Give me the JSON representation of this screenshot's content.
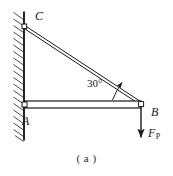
{
  "figure": {
    "caption": "( a )",
    "background_color": "#ffffff",
    "line_color": "#1a1a1a",
    "labels": {
      "joint_c": "C",
      "joint_a": "A",
      "joint_b": "B",
      "angle": "30°",
      "force_symbol": "F",
      "force_subscript": "P"
    },
    "geometry": {
      "wall_x": 24,
      "wall_top_y": 12,
      "wall_bottom_y": 140,
      "joint_c": [
        24,
        27
      ],
      "joint_a": [
        24,
        104
      ],
      "joint_b": [
        141,
        104
      ],
      "beam_top_y": 101,
      "beam_bottom_y": 108,
      "force_arrow_start": [
        141,
        108
      ],
      "force_arrow_end": [
        141,
        138
      ],
      "angle_value_degrees": 30
    }
  }
}
